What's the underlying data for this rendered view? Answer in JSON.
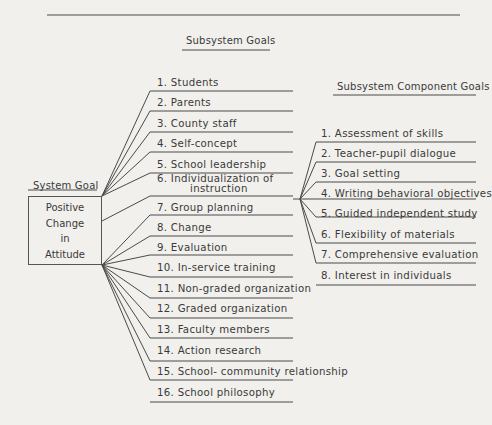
{
  "headers": {
    "subsystem_goals": "Subsystem Goals",
    "subsystem_component_goals": "Subsystem Component Goals",
    "system_goal": "System Goal"
  },
  "system_goal": {
    "lines": [
      "Positive",
      "Change",
      "in",
      "Attitude"
    ]
  },
  "subsystem_goals": [
    {
      "label": "1. Students"
    },
    {
      "label": "2. Parents"
    },
    {
      "label": "3. County staff"
    },
    {
      "label": "4. Self-concept"
    },
    {
      "label": "5. School leadership"
    },
    {
      "label": "6. Individualization of",
      "label2": "instruction"
    },
    {
      "label": "7. Group planning"
    },
    {
      "label": "8. Change"
    },
    {
      "label": "9. Evaluation"
    },
    {
      "label": "10. In-service training"
    },
    {
      "label": "11. Non-graded organization"
    },
    {
      "label": "12. Graded organization"
    },
    {
      "label": "13. Faculty members"
    },
    {
      "label": "14. Action research"
    },
    {
      "label": "15. School- community relationship"
    },
    {
      "label": "16. School philosophy"
    }
  ],
  "component_goals": [
    {
      "label": "1. Assessment of skills"
    },
    {
      "label": "2. Teacher-pupil dialogue"
    },
    {
      "label": "3. Goal setting"
    },
    {
      "label": "4. Writing behavioral objectives"
    },
    {
      "label": "5. Guided independent study"
    },
    {
      "label": "6. Flexibility of materials"
    },
    {
      "label": "7. Comprehensive evaluation"
    },
    {
      "label": "8. Interest in individuals"
    }
  ]
}
